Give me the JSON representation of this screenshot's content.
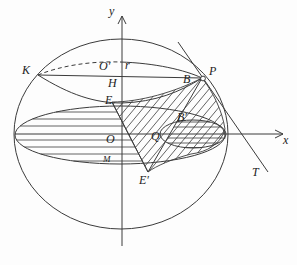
{
  "figure": {
    "type": "sphere-cross-section-diagram",
    "background": "#fdfdfd",
    "stroke_color": "#3b3b3b",
    "label_color": "#1c1c1c"
  },
  "axes": {
    "x_label": "x",
    "y_label": "y"
  },
  "labels": {
    "K": "K",
    "O_prime": "O′",
    "r": "r",
    "H": "H",
    "E": "E",
    "B": "B",
    "P": "P",
    "O": "O",
    "Q": "Q",
    "B_prime": "B′",
    "E_prime": "E′",
    "M": "M",
    "T": "T"
  }
}
